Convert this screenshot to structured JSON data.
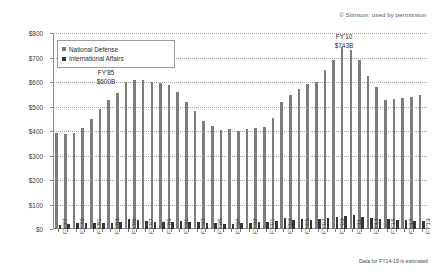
{
  "copyright": "© Stimson; used by permission",
  "footnote": "Data for FY14-19 is estimated",
  "legend": {
    "items": [
      {
        "label": "National Defense",
        "color": "#7d7d7d"
      },
      {
        "label": "International Affairs",
        "color": "#363636"
      }
    ]
  },
  "annotations": [
    {
      "id": "fy85",
      "year": "FY'85",
      "value": "$600B"
    },
    {
      "id": "fy10",
      "year": "FY'10",
      "value": "$743B"
    }
  ],
  "chart_data": {
    "type": "bar",
    "title": "",
    "subtitle": "",
    "xlabel": "",
    "ylabel": "",
    "ylim": [
      0,
      800
    ],
    "ytick_labels": [
      "$0",
      "$100",
      "$200",
      "$300",
      "$400",
      "$500",
      "$600",
      "$700",
      "$800"
    ],
    "ytick_values": [
      0,
      100,
      200,
      300,
      400,
      500,
      600,
      700,
      800
    ],
    "grid": true,
    "legend_position": "upper-left",
    "units": "Billions of constant dollars",
    "categories": [
      "FY'77",
      "FY'78",
      "FY'79",
      "FY'80",
      "FY'81",
      "FY'82",
      "FY'83",
      "FY'84",
      "FY'85",
      "FY'86",
      "FY'87",
      "FY'88",
      "FY'89",
      "FY'90",
      "FY'91",
      "FY'92",
      "FY'93",
      "FY'94",
      "FY'95",
      "FY'96",
      "FY'97",
      "FY'98",
      "FY'99",
      "FY'00",
      "FY'01",
      "FY'02",
      "FY'03",
      "FY'04",
      "FY'05",
      "FY'06",
      "FY'07",
      "FY'08",
      "FY'09",
      "FY'10",
      "FY'11",
      "FY'12",
      "FY'13",
      "FY'14",
      "FY'15",
      "FY'16",
      "FY'17",
      "FY'18",
      "FY'19"
    ],
    "tick_labels_shown": [
      "FY'77",
      "FY'79",
      "FY'81",
      "FY'83",
      "FY'85",
      "FY'87",
      "FY'89",
      "FY'91",
      "FY'93",
      "FY'95",
      "FY'97",
      "FY'99",
      "FY'01",
      "FY'03",
      "FY'05",
      "FY'07",
      "FY'09",
      "FY'11",
      "FY'13",
      "FY'15",
      "FY'17",
      "FY'19"
    ],
    "series": [
      {
        "name": "National Defense",
        "color": "#7d7d7d",
        "values": [
          392,
          388,
          392,
          412,
          448,
          490,
          525,
          555,
          600,
          610,
          608,
          600,
          598,
          588,
          560,
          520,
          480,
          440,
          422,
          405,
          408,
          400,
          408,
          412,
          418,
          455,
          520,
          545,
          570,
          590,
          600,
          650,
          690,
          743,
          730,
          690,
          625,
          580,
          525,
          530,
          535,
          540,
          545
        ]
      },
      {
        "name": "International Affairs",
        "color": "#363636",
        "values": [
          18,
          22,
          24,
          26,
          25,
          24,
          26,
          28,
          42,
          38,
          34,
          30,
          28,
          30,
          32,
          30,
          28,
          26,
          25,
          22,
          22,
          23,
          26,
          27,
          28,
          32,
          45,
          38,
          40,
          38,
          40,
          44,
          50,
          55,
          58,
          50,
          46,
          42,
          40,
          38,
          36,
          34,
          32
        ]
      }
    ]
  }
}
